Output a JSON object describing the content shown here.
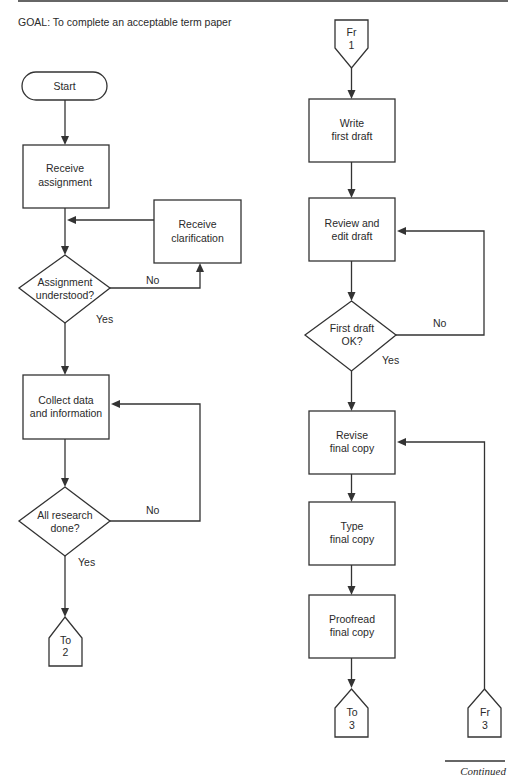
{
  "goal": "GOAL: To complete an acceptable term paper",
  "left_column": {
    "start": "Start",
    "receive_assignment": [
      "Receive",
      "assignment"
    ],
    "receive_clarification": [
      "Receive",
      "clarification"
    ],
    "assignment_understood": [
      "Assignment",
      "understood?"
    ],
    "assignment_no": "No",
    "assignment_yes": "Yes",
    "collect_data": [
      "Collect data",
      "and information"
    ],
    "all_research_done": [
      "All research",
      "done?"
    ],
    "research_no": "No",
    "research_yes": "Yes",
    "to_connector": [
      "To",
      "2"
    ]
  },
  "right_column": {
    "from_connector_top": [
      "Fr",
      "1"
    ],
    "write_first_draft": [
      "Write",
      "first draft"
    ],
    "review_edit_draft": [
      "Review and",
      "edit draft"
    ],
    "first_draft_ok": [
      "First draft",
      "OK?"
    ],
    "draft_no": "No",
    "draft_yes": "Yes",
    "revise_final_copy": [
      "Revise",
      "final copy"
    ],
    "type_final_copy": [
      "Type",
      "final copy"
    ],
    "proofread_final_copy": [
      "Proofread",
      "final copy"
    ],
    "to_connector": [
      "To",
      "3"
    ],
    "from_connector_bottom": [
      "Fr",
      "3"
    ]
  },
  "footer": {
    "continued": "Continued"
  }
}
